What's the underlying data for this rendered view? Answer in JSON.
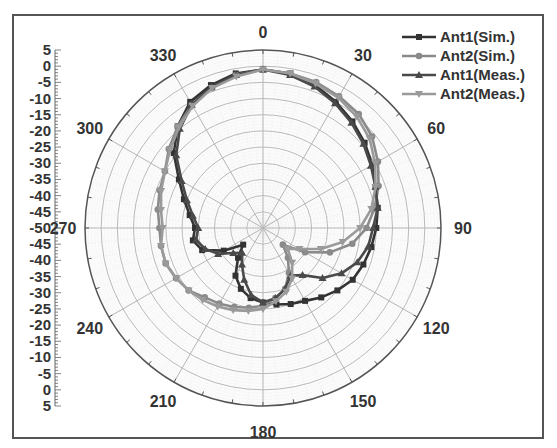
{
  "chart_data": {
    "type": "polar-line",
    "title": "",
    "radial_axis": {
      "min": -50,
      "max": 5,
      "step": 5,
      "tick_labels_upper": [
        "5",
        "0",
        "-5",
        "-10",
        "-15",
        "-20",
        "-25",
        "-30",
        "-35",
        "-40",
        "-45",
        "-50"
      ],
      "tick_labels_lower": [
        "-45",
        "-40",
        "-35",
        "-30",
        "-25",
        "-20",
        "-15",
        "-10",
        "-5",
        "0",
        "5"
      ]
    },
    "angular_axis": {
      "labels": [
        "0",
        "30",
        "60",
        "90",
        "120",
        "150",
        "180",
        "210",
        "240",
        "270",
        "300",
        "330"
      ],
      "direction": "clockwise",
      "zero": "top"
    },
    "grid": true,
    "legend": {
      "position": "top-right",
      "entries": [
        {
          "name": "Ant1(Sim.)",
          "marker": "square",
          "color": "#333333"
        },
        {
          "name": "Ant2(Sim.)",
          "marker": "circle",
          "color": "#8a8a8a"
        },
        {
          "name": "Ant1(Meas.)",
          "marker": "triangle-up",
          "color": "#4a4a4a"
        },
        {
          "name": "Ant2(Meas.)",
          "marker": "triangle-down",
          "color": "#9a9a9a"
        }
      ]
    },
    "angles": [
      0,
      10,
      20,
      30,
      40,
      50,
      60,
      70,
      80,
      90,
      100,
      110,
      120,
      130,
      140,
      150,
      160,
      170,
      180,
      190,
      200,
      210,
      220,
      230,
      240,
      250,
      260,
      270,
      280,
      290,
      300,
      310,
      320,
      330,
      340,
      350
    ],
    "series": [
      {
        "name": "Ant1(Sim.)",
        "values": [
          -1,
          -1.5,
          -3,
          -5,
          -7,
          -9,
          -11,
          -13,
          -14,
          -15,
          -16,
          -17,
          -18,
          -20,
          -22,
          -24,
          -25,
          -26,
          -27,
          -28,
          -30,
          -33,
          -38,
          -42,
          -36,
          -30,
          -28,
          -29,
          -27,
          -24,
          -20,
          -14,
          -9,
          -5,
          -3,
          -1.5
        ]
      },
      {
        "name": "Ant2(Sim.)",
        "values": [
          -1,
          -1.5,
          -2,
          -3,
          -4,
          -6,
          -9,
          -12,
          -15,
          -18,
          -22,
          -28,
          -35,
          -42,
          -38,
          -34,
          -30,
          -28,
          -26,
          -25,
          -24,
          -23,
          -22,
          -20,
          -19,
          -18,
          -18,
          -18,
          -17,
          -16,
          -15,
          -12,
          -9,
          -6,
          -4,
          -2
        ]
      },
      {
        "name": "Ant1(Meas.)",
        "values": [
          -1,
          -2,
          -3.5,
          -5.5,
          -7.5,
          -9.5,
          -11.5,
          -13,
          -14,
          -16,
          -17,
          -19,
          -22,
          -26,
          -31,
          -33,
          -30,
          -28,
          -27,
          -29,
          -33,
          -37,
          -40,
          -38,
          -34,
          -31,
          -29,
          -30,
          -28,
          -25,
          -21,
          -15,
          -10,
          -6,
          -3.5,
          -2
        ]
      },
      {
        "name": "Ant2(Meas.)",
        "values": [
          -1,
          -1.5,
          -2.5,
          -3.5,
          -5,
          -7,
          -10,
          -13,
          -16,
          -20,
          -25,
          -31,
          -37,
          -40,
          -36,
          -32,
          -29,
          -27,
          -25,
          -24,
          -23,
          -22,
          -21,
          -20,
          -19,
          -18,
          -18,
          -19,
          -18,
          -16.5,
          -15,
          -12.5,
          -9.5,
          -6.5,
          -4,
          -2.5
        ]
      }
    ]
  }
}
